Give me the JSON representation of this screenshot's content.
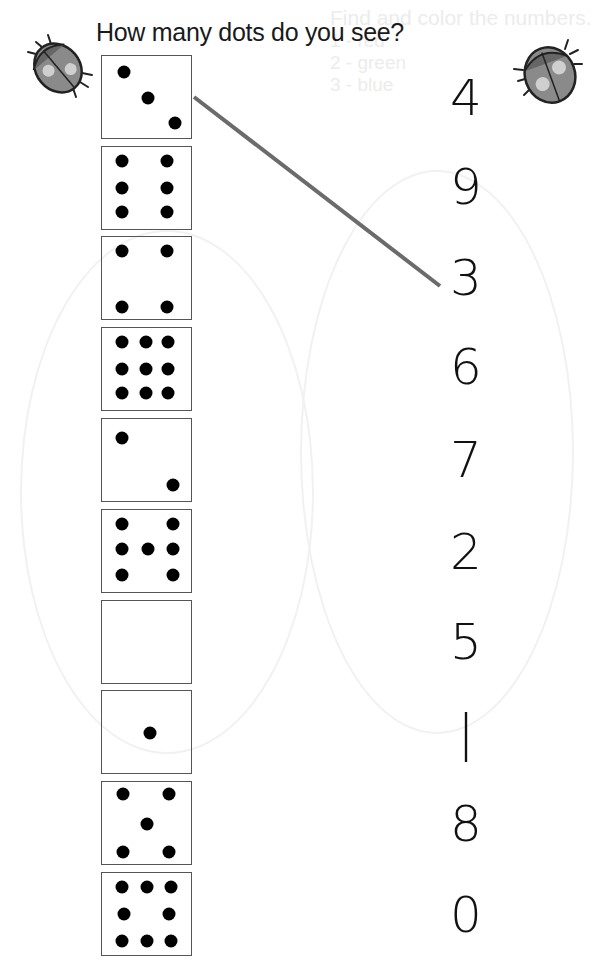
{
  "worksheet": {
    "title": "How many dots do you see?",
    "boxes": [
      {
        "count": 3,
        "dots": [
          [
            25,
            20
          ],
          [
            52,
            51
          ],
          [
            82,
            82
          ]
        ]
      },
      {
        "count": 6,
        "dots": [
          [
            23,
            17
          ],
          [
            73,
            17
          ],
          [
            23,
            50
          ],
          [
            73,
            50
          ],
          [
            23,
            79
          ],
          [
            73,
            79
          ]
        ]
      },
      {
        "count": 4,
        "dots": [
          [
            23,
            17
          ],
          [
            73,
            17
          ],
          [
            23,
            85
          ],
          [
            73,
            85
          ]
        ]
      },
      {
        "count": 9,
        "dots": [
          [
            23,
            17
          ],
          [
            49,
            17
          ],
          [
            74,
            17
          ],
          [
            23,
            50
          ],
          [
            49,
            50
          ],
          [
            74,
            50
          ],
          [
            23,
            79
          ],
          [
            49,
            79
          ],
          [
            74,
            79
          ]
        ]
      },
      {
        "count": 2,
        "dots": [
          [
            23,
            23
          ],
          [
            80,
            80
          ]
        ]
      },
      {
        "count": 7,
        "dots": [
          [
            23,
            17
          ],
          [
            80,
            17
          ],
          [
            23,
            48
          ],
          [
            52,
            48
          ],
          [
            80,
            48
          ],
          [
            23,
            79
          ],
          [
            80,
            79
          ]
        ]
      },
      {
        "count": 0,
        "dots": []
      },
      {
        "count": 1,
        "dots": [
          [
            54,
            51
          ]
        ]
      },
      {
        "count": 5,
        "dots": [
          [
            24,
            15
          ],
          [
            75,
            15
          ],
          [
            50,
            51
          ],
          [
            24,
            85
          ],
          [
            75,
            85
          ]
        ]
      },
      {
        "count": 8,
        "dots": [
          [
            23,
            17
          ],
          [
            50,
            17
          ],
          [
            77,
            17
          ],
          [
            25,
            50
          ],
          [
            75,
            50
          ],
          [
            23,
            83
          ],
          [
            50,
            83
          ],
          [
            77,
            83
          ]
        ]
      }
    ],
    "numbers": [
      "4",
      "9",
      "3",
      "6",
      "7",
      "2",
      "5",
      "1",
      "8",
      "0"
    ],
    "connection": {
      "from_box": 1,
      "to_number": "3",
      "color": "#6b6b6b"
    }
  },
  "bleed_through": {
    "heading": "Find and color the numbers.",
    "rows": [
      [
        "1 - red",
        "4 - orange",
        "7 - black"
      ],
      [
        "2 - green",
        "5 - yellow",
        "8 - white"
      ],
      [
        "3 - blue",
        "6 - purple",
        "9 - brown"
      ]
    ]
  }
}
